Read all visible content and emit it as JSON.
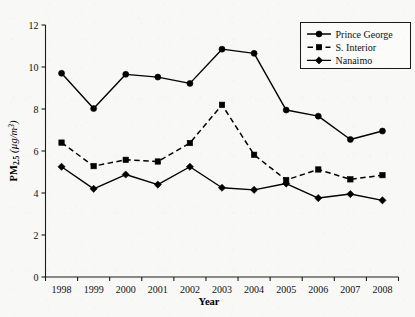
{
  "chart_data": {
    "type": "line",
    "title": "",
    "xlabel": "Year",
    "ylabel": "PM2.5 (µg/m³)",
    "ylabel_parts": {
      "base": "PM",
      "subscript": "2.5",
      "units": " (µg/m",
      "superscript": "3",
      "units_close": ")"
    },
    "categories": [
      1998,
      1999,
      2000,
      2001,
      2002,
      2003,
      2004,
      2005,
      2006,
      2007,
      2008
    ],
    "x_tick_labels": [
      "1998",
      "1999",
      "2000",
      "2001",
      "2002",
      "2003",
      "2004",
      "2005",
      "2006",
      "2007",
      "2008"
    ],
    "y_tick_labels": [
      "0",
      "2",
      "4",
      "6",
      "8",
      "10",
      "12"
    ],
    "y_ticks": [
      0,
      2,
      4,
      6,
      8,
      10,
      12
    ],
    "ylim": [
      0,
      12
    ],
    "grid": false,
    "legend_position": "top-right",
    "series": [
      {
        "name": "Prince George",
        "marker": "circle",
        "linestyle": "solid",
        "color": "#000000",
        "values": [
          9.7,
          8.02,
          9.65,
          9.52,
          9.22,
          10.85,
          10.65,
          7.95,
          7.66,
          6.55,
          6.95
        ]
      },
      {
        "name": "S. Interior",
        "marker": "square",
        "linestyle": "dashed",
        "color": "#000000",
        "values": [
          6.4,
          5.28,
          5.58,
          5.5,
          6.38,
          8.2,
          5.82,
          4.62,
          5.12,
          4.65,
          4.85
        ]
      },
      {
        "name": "Nanaimo",
        "marker": "diamond",
        "linestyle": "solid",
        "color": "#000000",
        "values": [
          5.25,
          4.2,
          4.88,
          4.4,
          5.25,
          4.25,
          4.15,
          4.45,
          3.76,
          3.95,
          3.65
        ]
      }
    ]
  },
  "legend": {
    "entries": [
      {
        "label": "Prince George"
      },
      {
        "label": "S. Interior"
      },
      {
        "label": "Nanaimo"
      }
    ]
  }
}
